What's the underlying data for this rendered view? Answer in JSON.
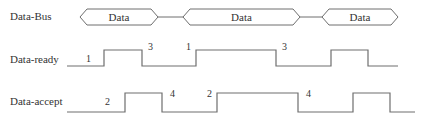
{
  "colors": {
    "line": "#6e6e6e",
    "text": "#333333",
    "background": "#ffffff"
  },
  "signals": [
    {
      "name": "Data-Bus",
      "label_y": 12,
      "type": "bus",
      "segments": [
        {
          "label": "Data",
          "x_start": 80,
          "x_end": 158
        },
        {
          "label": "Data",
          "x_start": 183,
          "x_end": 300
        },
        {
          "label": "Data",
          "x_start": 322,
          "x_end": 398
        }
      ],
      "y_center": 17,
      "half_height": 8
    },
    {
      "name": "Data-ready",
      "label_y": 56,
      "type": "digital",
      "y_high": 50,
      "y_low": 66,
      "x_start": 67,
      "x_end": 398,
      "initial_level": "low",
      "transitions": [
        104,
        142,
        196,
        276,
        331,
        368
      ],
      "step_labels": [
        {
          "text": "1",
          "x": 86,
          "y": 62
        },
        {
          "text": "3",
          "x": 148,
          "y": 50
        },
        {
          "text": "1",
          "x": 186,
          "y": 50
        },
        {
          "text": "3",
          "x": 282,
          "y": 50
        }
      ]
    },
    {
      "name": "Data-accept",
      "label_y": 98,
      "type": "digital",
      "y_high": 93,
      "y_low": 112,
      "x_start": 67,
      "x_end": 415,
      "initial_level": "low",
      "transitions": [
        125,
        162,
        217,
        298,
        353,
        390
      ],
      "step_labels": [
        {
          "text": "2",
          "x": 105,
          "y": 105
        },
        {
          "text": "4",
          "x": 170,
          "y": 97
        },
        {
          "text": "2",
          "x": 207,
          "y": 97
        },
        {
          "text": "4",
          "x": 306,
          "y": 97
        }
      ]
    }
  ]
}
